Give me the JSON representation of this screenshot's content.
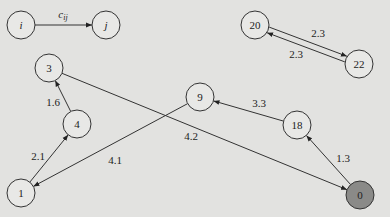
{
  "diagram": {
    "type": "directed-weighted-graph",
    "background": "#e2e2e0",
    "node_radius": 14,
    "legend": {
      "from": "i",
      "to": "j",
      "weight_label": "c_ij"
    },
    "nodes": [
      {
        "id": "i",
        "label": "i",
        "x": 21,
        "y": 25,
        "fill": "#e8e8e6",
        "italic": true
      },
      {
        "id": "j",
        "label": "j",
        "x": 106,
        "y": 25,
        "fill": "#e8e8e6",
        "italic": true
      },
      {
        "id": "20",
        "label": "20",
        "x": 255,
        "y": 25,
        "fill": "#e8e8e6"
      },
      {
        "id": "22",
        "label": "22",
        "x": 359,
        "y": 64,
        "fill": "#e8e8e6"
      },
      {
        "id": "3",
        "label": "3",
        "x": 49,
        "y": 68,
        "fill": "#e8e8e6"
      },
      {
        "id": "4",
        "label": "4",
        "x": 77,
        "y": 124,
        "fill": "#e8e8e6"
      },
      {
        "id": "9",
        "label": "9",
        "x": 200,
        "y": 97,
        "fill": "#e8e8e6"
      },
      {
        "id": "18",
        "label": "18",
        "x": 297,
        "y": 125,
        "fill": "#e8e8e6"
      },
      {
        "id": "1",
        "label": "1",
        "x": 21,
        "y": 193,
        "fill": "#e8e8e6"
      },
      {
        "id": "0",
        "label": "0",
        "x": 360,
        "y": 195,
        "fill": "#8a8a88"
      }
    ],
    "edges": [
      {
        "from": "i",
        "to": "j",
        "label": "c_ij",
        "lx": 63,
        "ly": 14
      },
      {
        "from": "20",
        "to": "22",
        "label": "2.3",
        "lx": 318,
        "ly": 33,
        "offset": -3
      },
      {
        "from": "22",
        "to": "20",
        "label": "2.3",
        "lx": 296,
        "ly": 54,
        "offset": -3
      },
      {
        "from": "4",
        "to": "3",
        "label": "1.6",
        "lx": 53,
        "ly": 102
      },
      {
        "from": "1",
        "to": "4",
        "label": "2.1",
        "lx": 38,
        "ly": 156
      },
      {
        "from": "9",
        "to": "1",
        "label": "4.1",
        "lx": 115,
        "ly": 160
      },
      {
        "from": "3",
        "to": "0",
        "label": "4.2",
        "lx": 191,
        "ly": 136
      },
      {
        "from": "18",
        "to": "9",
        "label": "3.3",
        "lx": 259,
        "ly": 103
      },
      {
        "from": "0",
        "to": "18",
        "label": "1.3",
        "lx": 343,
        "ly": 158
      }
    ]
  }
}
